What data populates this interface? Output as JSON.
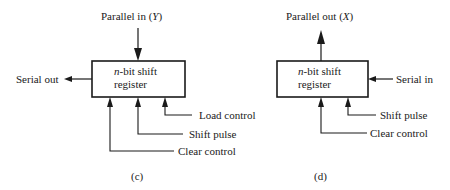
{
  "diagrams": [
    {
      "id": "c",
      "caption": "(c)",
      "box": {
        "line1_italic": "n",
        "line1_rest": "-bit shift",
        "line2": "register"
      },
      "labels": {
        "top": {
          "text": "Parallel in (",
          "var": "Y",
          "close": ")"
        },
        "left": "Serial out",
        "bottom": [
          "Load control",
          "Shift pulse",
          "Clear control"
        ]
      }
    },
    {
      "id": "d",
      "caption": "(d)",
      "box": {
        "line1_italic": "n",
        "line1_rest": "-bit shift",
        "line2": "register"
      },
      "labels": {
        "top": {
          "text": "Parallel out (",
          "var": "X",
          "close": ")"
        },
        "right": "Serial in",
        "bottom": [
          "Shift pulse",
          "Clear control"
        ]
      }
    }
  ],
  "colors": {
    "ink": "#1a1a1a",
    "background": "#ffffff"
  }
}
